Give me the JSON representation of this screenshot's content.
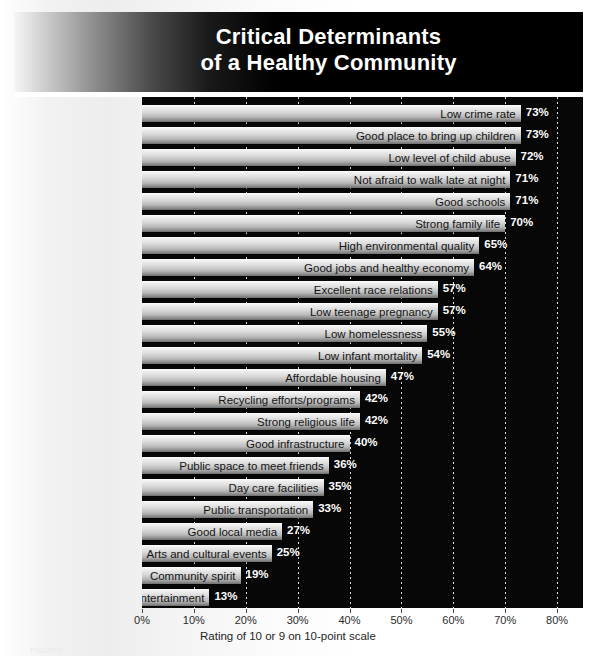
{
  "header": {
    "title_line1": "Critical Determinants",
    "title_line2": "of a Healthy Community"
  },
  "axis": {
    "caption": "Rating of 10 or 9 on 10-point scale",
    "tick_labels": [
      "0%",
      "10%",
      "20%",
      "30%",
      "40%",
      "50%",
      "60%",
      "70%",
      "80%"
    ]
  },
  "figure": {
    "caption": "FIGURE"
  },
  "chart_data": {
    "type": "bar",
    "orientation": "horizontal",
    "title": "Critical Determinants of a Healthy Community",
    "xlabel": "Rating of 10 or 9 on 10-point scale",
    "ylabel": "",
    "xlim": [
      0,
      85
    ],
    "xticks": [
      0,
      10,
      20,
      30,
      40,
      50,
      60,
      70,
      80
    ],
    "xtick_labels": [
      "0%",
      "10%",
      "20%",
      "30%",
      "40%",
      "50%",
      "60%",
      "70%",
      "80%"
    ],
    "grid": "vertical-dotted",
    "legend": "none",
    "value_format": "percent",
    "categories": [
      "Low crime rate",
      "Good place to bring up children",
      "Low level of child abuse",
      "Not afraid to walk late at night",
      "Good schools",
      "Strong family life",
      "High environmental quality",
      "Good jobs and healthy economy",
      "Excellent race relations",
      "Low teenage pregnancy",
      "Low homelessness",
      "Low infant mortality",
      "Affordable housing",
      "Recycling efforts/programs",
      "Strong religious life",
      "Good infrastructure",
      "Public space to meet friends",
      "Day care facilities",
      "Public transportation",
      "Good local media",
      "Arts and cultural events",
      "Community spirit",
      "Entertainment"
    ],
    "values": [
      73,
      73,
      72,
      71,
      71,
      70,
      65,
      64,
      57,
      57,
      55,
      54,
      47,
      42,
      42,
      40,
      36,
      35,
      33,
      27,
      25,
      19,
      13
    ],
    "value_labels": [
      "73%",
      "73%",
      "72%",
      "71%",
      "71%",
      "70%",
      "65%",
      "64%",
      "57%",
      "57%",
      "55%",
      "54%",
      "47%",
      "42%",
      "42%",
      "40%",
      "36%",
      "35%",
      "33%",
      "27%",
      "25%",
      "19%",
      "13%"
    ]
  },
  "colors": {
    "plot_background": "#070707",
    "gridline": "#ffffff",
    "bar_light": "#ffffff",
    "bar_dark": "#6e6e6e",
    "value_text": "#ffffff",
    "label_text": "#141414",
    "banner_dark": "#000000"
  }
}
